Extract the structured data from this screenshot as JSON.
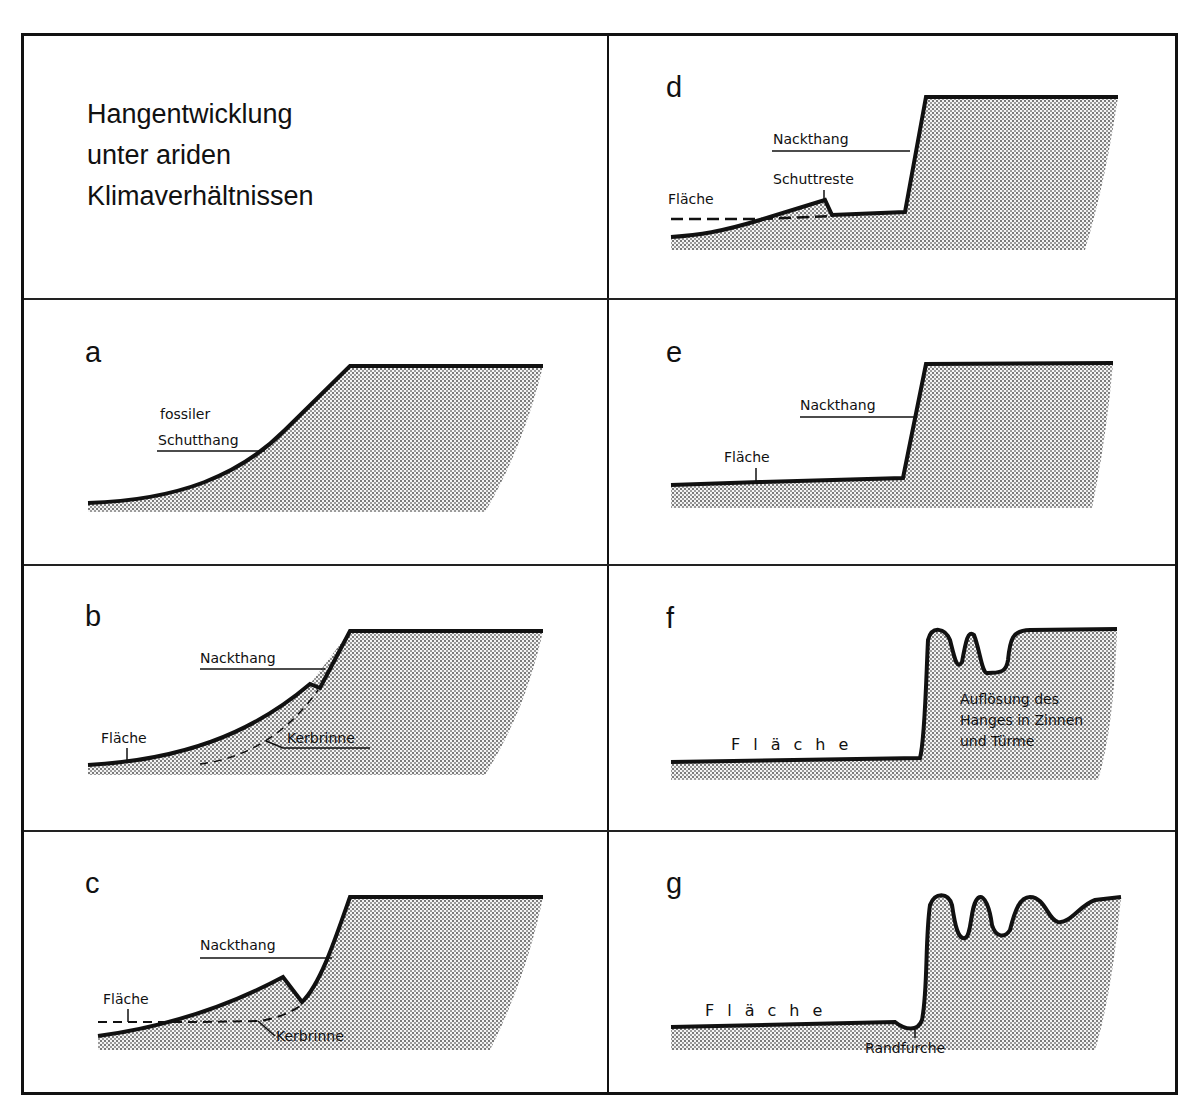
{
  "figure": {
    "title_lines": [
      "Hangentwicklung",
      "unter ariden",
      "Klimaverhältnissen"
    ],
    "colors": {
      "ink": "#111111",
      "stipple": "#8a8a8a",
      "background": "#ffffff"
    },
    "panels": [
      {
        "id": "a",
        "letter": "a",
        "labels": [
          "fossiler",
          "Schutthang"
        ]
      },
      {
        "id": "b",
        "letter": "b",
        "labels": [
          "Nackthang",
          "Fläche",
          "Kerbrinne"
        ]
      },
      {
        "id": "c",
        "letter": "c",
        "labels": [
          "Nackthang",
          "Fläche",
          "Kerbrinne"
        ]
      },
      {
        "id": "d",
        "letter": "d",
        "labels": [
          "Nackthang",
          "Schuttreste",
          "Fläche"
        ]
      },
      {
        "id": "e",
        "letter": "e",
        "labels": [
          "Nackthang",
          "Fläche"
        ]
      },
      {
        "id": "f",
        "letter": "f",
        "labels": [
          "Fläche",
          "Auflösung des",
          "Hanges in Zinnen",
          "und Türme"
        ]
      },
      {
        "id": "g",
        "letter": "g",
        "labels": [
          "Fläche",
          "Randfurche"
        ]
      }
    ]
  }
}
